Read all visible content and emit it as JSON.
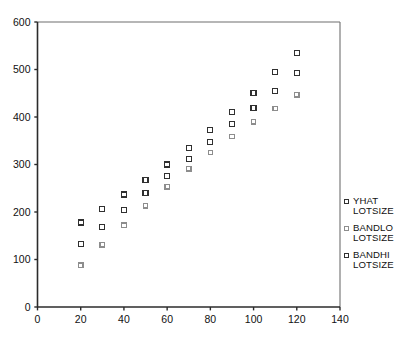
{
  "chart_data": {
    "type": "scatter",
    "title": "",
    "subtitle": "",
    "xlabel": "",
    "ylabel": "",
    "xlim": [
      0,
      140
    ],
    "ylim": [
      0,
      600
    ],
    "xticks": [
      0,
      20,
      40,
      60,
      80,
      100,
      120,
      140
    ],
    "yticks": [
      0,
      100,
      200,
      300,
      400,
      500,
      600
    ],
    "grid": false,
    "legend_position": "right",
    "marker": "open-square",
    "x": [
      20,
      30,
      40,
      50,
      60,
      70,
      80,
      90,
      100,
      110,
      120
    ],
    "series": [
      {
        "name": "YHAT LOTSIZE",
        "label_line1": "YHAT",
        "label_line2": "LOTSIZE",
        "color": "#303030",
        "values": [
          133,
          168,
          204,
          240,
          276,
          312,
          348,
          386,
          419,
          455,
          492
        ]
      },
      {
        "name": "BANDLO LOTSIZE",
        "label_line1": "BANDLO",
        "label_line2": "LOTSIZE",
        "color": "#8d8d8d",
        "values": [
          88,
          131,
          172,
          213,
          253,
          291,
          325,
          359,
          390,
          418,
          447
        ]
      },
      {
        "name": "BANDHI LOTSIZE",
        "label_line1": "BANDHI",
        "label_line2": "LOTSIZE",
        "color": "#303030",
        "values": [
          178,
          207,
          237,
          267,
          300,
          335,
          373,
          411,
          451,
          494,
          535
        ]
      }
    ]
  },
  "legend": {
    "entries": [
      {
        "line1": "YHAT",
        "line2": "LOTSIZE"
      },
      {
        "line1": "BANDLO",
        "line2": "LOTSIZE"
      },
      {
        "line1": "BANDHI",
        "line2": "LOTSIZE"
      }
    ]
  }
}
